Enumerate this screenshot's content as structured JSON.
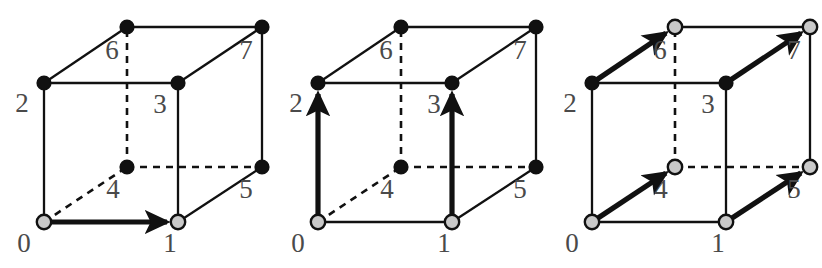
{
  "figure": {
    "title": "",
    "background_color": "#ffffff",
    "line_color": "#111111",
    "label_color": "#4a4a4a",
    "filled_node_color": "#111111",
    "open_node_color": "#c9c9c9",
    "panel_count": 3
  },
  "geometry": {
    "note": "Shared cube vertex pixel positions within each 274x268 panel",
    "vertices": {
      "0": {
        "label": "0",
        "x": 44,
        "y": 222,
        "label_x": 24,
        "label_y": 252
      },
      "1": {
        "label": "1",
        "x": 178,
        "y": 222,
        "label_x": 170,
        "label_y": 252
      },
      "2": {
        "label": "2",
        "x": 44,
        "y": 83,
        "label_x": 22,
        "label_y": 112
      },
      "3": {
        "label": "3",
        "x": 178,
        "y": 83,
        "label_x": 160,
        "label_y": 113
      },
      "4": {
        "label": "4",
        "x": 127,
        "y": 167,
        "label_x": 113,
        "label_y": 198
      },
      "5": {
        "label": "5",
        "x": 262,
        "y": 167,
        "label_x": 246,
        "label_y": 198
      },
      "6": {
        "label": "6",
        "x": 127,
        "y": 27,
        "label_x": 112,
        "label_y": 59
      },
      "7": {
        "label": "7",
        "x": 262,
        "y": 27,
        "label_x": 246,
        "label_y": 59
      }
    },
    "edges_solid": [
      [
        "0",
        "1"
      ],
      [
        "0",
        "2"
      ],
      [
        "1",
        "3"
      ],
      [
        "2",
        "3"
      ],
      [
        "2",
        "6"
      ],
      [
        "3",
        "7"
      ],
      [
        "6",
        "7"
      ],
      [
        "1",
        "5"
      ],
      [
        "5",
        "7"
      ]
    ],
    "edges_dashed": [
      [
        "0",
        "4"
      ],
      [
        "4",
        "5"
      ],
      [
        "4",
        "6"
      ]
    ]
  },
  "panels": [
    {
      "name": "panel-a",
      "caption": "",
      "offset_x": 0,
      "arrows": [
        [
          "0",
          "1"
        ]
      ],
      "open_nodes": [
        "0",
        "1"
      ],
      "filled_nodes": [
        "2",
        "3",
        "4",
        "5",
        "6",
        "7"
      ]
    },
    {
      "name": "panel-b",
      "caption": "",
      "offset_x": 274,
      "arrows": [
        [
          "0",
          "2"
        ],
        [
          "1",
          "3"
        ]
      ],
      "open_nodes": [
        "0",
        "1"
      ],
      "filled_nodes": [
        "2",
        "3",
        "4",
        "5",
        "6",
        "7"
      ]
    },
    {
      "name": "panel-c",
      "caption": "",
      "offset_x": 548,
      "arrows": [
        [
          "0",
          "4"
        ],
        [
          "1",
          "5"
        ],
        [
          "2",
          "6"
        ],
        [
          "3",
          "7"
        ]
      ],
      "open_nodes": [
        "0",
        "1",
        "4",
        "5",
        "6",
        "7"
      ],
      "filled_nodes": [
        "2",
        "3"
      ]
    }
  ]
}
